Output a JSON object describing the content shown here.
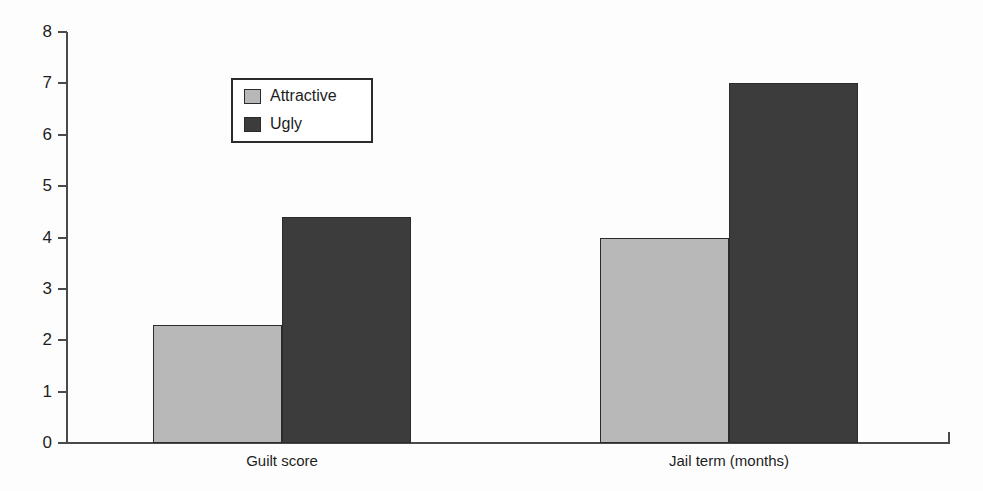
{
  "chart_data": {
    "type": "bar",
    "title": "",
    "subtitle": "",
    "xlabel": "",
    "ylabel": "",
    "categories": [
      "Guilt score",
      "Jail term (months)"
    ],
    "series": [
      {
        "name": "Attractive",
        "color": "#b8b8b8",
        "values": [
          2.3,
          4.0
        ]
      },
      {
        "name": "Ugly",
        "color": "#3c3c3c",
        "values": [
          4.4,
          7.0
        ]
      }
    ],
    "ylim": [
      0,
      8
    ],
    "ytick_labels": [
      "0",
      "1",
      "2",
      "3",
      "4",
      "5",
      "6",
      "7",
      "8"
    ],
    "ytick_values": [
      0,
      1,
      2,
      3,
      4,
      5,
      6,
      7,
      8
    ],
    "grid": false,
    "legend_position": "upper-left-inside",
    "annotations": []
  },
  "legend": {
    "entries": [
      {
        "label": "Attractive",
        "color": "#b8b8b8"
      },
      {
        "label": "Ugly",
        "color": "#3c3c3c"
      }
    ]
  },
  "axes": {
    "y_labels": [
      "8",
      "7",
      "6",
      "5",
      "4",
      "3",
      "2",
      "1",
      "0"
    ],
    "x_labels": [
      "Guilt score",
      "Jail term (months)"
    ]
  },
  "colors": {
    "attractive": "#b8b8b8",
    "ugly": "#3c3c3c",
    "axis": "#4a4a4a",
    "text": "#1d1d1d",
    "background": "#fdfdfd"
  }
}
